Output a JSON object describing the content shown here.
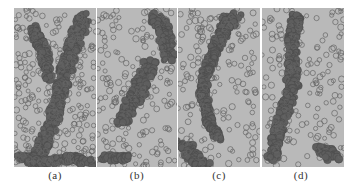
{
  "figure": {
    "panels": [
      {
        "id": "a",
        "label": "(a)",
        "left": 14,
        "width": 82
      },
      {
        "id": "b",
        "label": "(b)",
        "left": 97,
        "width": 80
      },
      {
        "id": "c",
        "label": "(c)",
        "left": 178,
        "width": 82
      },
      {
        "id": "d",
        "label": "(d)",
        "left": 262,
        "width": 82
      }
    ],
    "colors": {
      "background": "#b9b9b9",
      "circle_stroke": "#6a6a6a",
      "cluster": "#5e5e5e",
      "separator": "#e8e8e8"
    }
  }
}
